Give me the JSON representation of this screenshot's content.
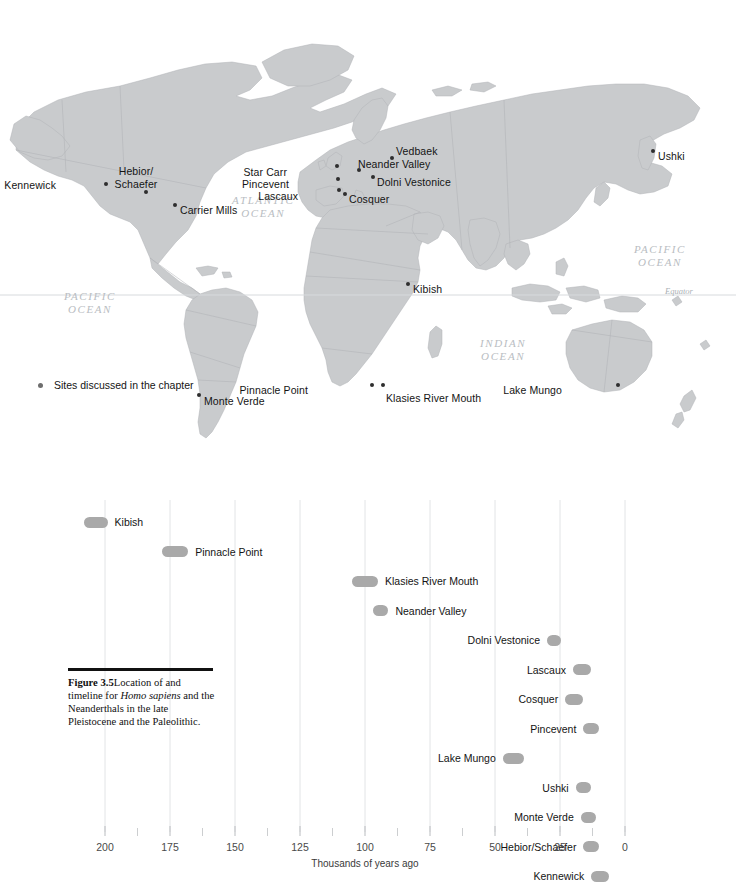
{
  "figure": {
    "number": "Figure 3.5",
    "caption_lead": "Figure 3.5",
    "caption_part1": "Location of and timeline for ",
    "caption_italic": "Homo sapiens",
    "caption_part2": " and the Neanderthals in the late Pleistocene and the Paleolithic."
  },
  "map": {
    "legend_label": "Sites discussed in the chapter",
    "legend_icon": "map-dot-icon",
    "equator_label": "Equator",
    "ocean_labels": [
      {
        "name": "atlantic-ocean",
        "line1": "ATLANTIC",
        "line2": "OCEAN",
        "x": 232,
        "y": 194
      },
      {
        "name": "pacific-ocean-east",
        "line1": "PACIFIC",
        "line2": "OCEAN",
        "x": 634,
        "y": 243
      },
      {
        "name": "pacific-ocean-west",
        "line1": "PACIFIC",
        "line2": "OCEAN",
        "x": 64,
        "y": 290
      },
      {
        "name": "indian-ocean",
        "line1": "INDIAN",
        "line2": "OCEAN",
        "x": 480,
        "y": 337
      }
    ],
    "sites": [
      {
        "name": "kennewick",
        "label": "Kennewick",
        "dot_x": 106,
        "dot_y": 184,
        "label_x": 56,
        "label_y": 179,
        "align": "right"
      },
      {
        "name": "hebior-schaefer",
        "label": "Hebior/",
        "label2": "Schaefer",
        "dot_x": 146,
        "dot_y": 192,
        "label_x": 136,
        "label_y": 165,
        "align": "center"
      },
      {
        "name": "carrier-mills",
        "label": "Carrier Mills",
        "dot_x": 175,
        "dot_y": 205,
        "label_x": 180,
        "label_y": 204,
        "align": "left"
      },
      {
        "name": "monte-verde",
        "label": "Monte Verde",
        "dot_x": 199,
        "dot_y": 395,
        "label_x": 204,
        "label_y": 395,
        "align": "left"
      },
      {
        "name": "star-carr",
        "label": "Star Carr",
        "dot_x": 337,
        "dot_y": 166,
        "label_x": 287,
        "label_y": 166,
        "align": "right"
      },
      {
        "name": "vedbaek",
        "label": "Vedbaek",
        "dot_x": 392,
        "dot_y": 158,
        "label_x": 396,
        "label_y": 145,
        "align": "left"
      },
      {
        "name": "neander-valley",
        "label": "Neander Valley",
        "dot_x": 359,
        "dot_y": 170,
        "label_x": 358,
        "label_y": 158,
        "align": "left"
      },
      {
        "name": "pincevent",
        "label": "Pincevent",
        "dot_x": 338,
        "dot_y": 179,
        "label_x": 289,
        "label_y": 178,
        "align": "right"
      },
      {
        "name": "dolni-vestonice",
        "label": "Dolni Vestonice",
        "dot_x": 373,
        "dot_y": 177,
        "label_x": 377,
        "label_y": 176,
        "align": "left"
      },
      {
        "name": "lascaux",
        "label": "Lascaux",
        "dot_x": 339,
        "dot_y": 190,
        "label_x": 298,
        "label_y": 190,
        "align": "right"
      },
      {
        "name": "cosquer",
        "label": "Cosquer",
        "dot_x": 345,
        "dot_y": 194,
        "label_x": 349,
        "label_y": 193,
        "align": "left"
      },
      {
        "name": "ushki",
        "label": "Ushki",
        "dot_x": 653,
        "dot_y": 151,
        "label_x": 658,
        "label_y": 150,
        "align": "left"
      },
      {
        "name": "kibish",
        "label": "Kibish",
        "dot_x": 408,
        "dot_y": 284,
        "label_x": 413,
        "label_y": 283,
        "align": "left"
      },
      {
        "name": "pinnacle-point",
        "label": "Pinnacle Point",
        "dot_x": 372,
        "dot_y": 385,
        "label_x": 308,
        "label_y": 384,
        "align": "right"
      },
      {
        "name": "klasies-river-mouth",
        "label": "Klasies River Mouth",
        "dot_x": 383,
        "dot_y": 385,
        "label_x": 386,
        "label_y": 392,
        "align": "left"
      },
      {
        "name": "lake-mungo",
        "label": "Lake Mungo",
        "dot_x": 618,
        "dot_y": 385,
        "label_x": 562,
        "label_y": 384,
        "align": "right"
      }
    ]
  },
  "chart_data": {
    "type": "bar",
    "title": "",
    "xlabel": "Thousands of years ago",
    "ylabel": "",
    "xlim": [
      200,
      0
    ],
    "x_ticks": [
      200,
      175,
      150,
      125,
      100,
      75,
      50,
      25,
      0
    ],
    "x_minor_ticks": [
      187.5,
      162.5,
      137.5,
      112.5,
      87.5,
      62.5,
      37.5,
      12.5
    ],
    "grid": true,
    "legend": "none",
    "axis_direction": "reversed",
    "bars": [
      {
        "name": "kibish",
        "label": "Kibish",
        "start_ka": 208,
        "end_ka": 199,
        "label_side": "right"
      },
      {
        "name": "pinnacle-point",
        "label": "Pinnacle Point",
        "start_ka": 178,
        "end_ka": 168,
        "label_side": "right"
      },
      {
        "name": "klasies-river-mouth",
        "label": "Klasies River Mouth",
        "start_ka": 105,
        "end_ka": 95,
        "label_side": "right"
      },
      {
        "name": "neander-valley",
        "label": "Neander Valley",
        "start_ka": 97,
        "end_ka": 91,
        "label_side": "right"
      },
      {
        "name": "dolni-vestonice",
        "label": "Dolni Vestonice",
        "start_ka": 30,
        "end_ka": 25,
        "label_side": "left"
      },
      {
        "name": "lascaux",
        "label": "Lascaux",
        "start_ka": 20,
        "end_ka": 13,
        "label_side": "left"
      },
      {
        "name": "cosquer",
        "label": "Cosquer",
        "start_ka": 23,
        "end_ka": 16,
        "label_side": "left"
      },
      {
        "name": "pincevent",
        "label": "Pincevent",
        "start_ka": 16,
        "end_ka": 10,
        "label_side": "left"
      },
      {
        "name": "lake-mungo",
        "label": "Lake Mungo",
        "start_ka": 47,
        "end_ka": 39,
        "label_side": "left"
      },
      {
        "name": "ushki",
        "label": "Ushki",
        "start_ka": 19,
        "end_ka": 13,
        "label_side": "left"
      },
      {
        "name": "monte-verde",
        "label": "Monte Verde",
        "start_ka": 17,
        "end_ka": 11,
        "label_side": "left"
      },
      {
        "name": "hebior-schaefer",
        "label": "Hebior/Schaefer",
        "start_ka": 16,
        "end_ka": 10,
        "label_side": "left"
      },
      {
        "name": "kennewick",
        "label": "Kennewick",
        "start_ka": 13,
        "end_ka": 6,
        "label_side": "left"
      }
    ]
  },
  "colors": {
    "bar_fill": "#a9a9a9",
    "land_fill": "#c9cbcd",
    "grid_line": "#e2e4e6",
    "dot": "#2e2e2e",
    "ocean_text": "#b9bdc2"
  }
}
